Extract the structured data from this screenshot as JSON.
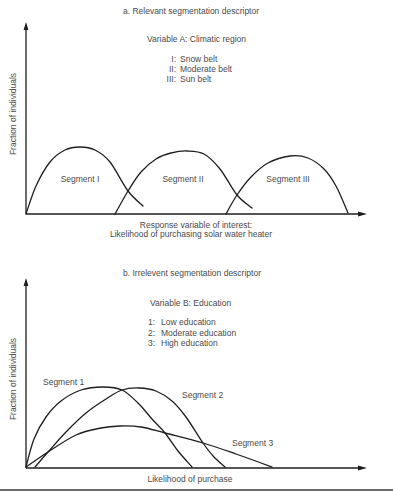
{
  "chart_data": [
    {
      "type": "line",
      "panel": "a",
      "title": "a. Relevant segmentation descriptor",
      "legend_title": "Variable A: Climatic region",
      "legend": [
        {
          "key": "I:",
          "label": "Snow belt"
        },
        {
          "key": "II:",
          "label": "Moderate belt"
        },
        {
          "key": "III:",
          "label": "Sun belt"
        }
      ],
      "xlabel_line1": "Response variable of interest:",
      "xlabel_line2": "Likelihood of purchasing solar water heater",
      "ylabel": "Fraction of individuals",
      "xlim": [
        0,
        340
      ],
      "ylim": [
        0,
        190
      ],
      "grid": false,
      "ticks": false,
      "series": [
        {
          "name": "Segment I",
          "points": [
            [
              0,
              0
            ],
            [
              10,
              28
            ],
            [
              24,
              52
            ],
            [
              39,
              64
            ],
            [
              54,
              67
            ],
            [
              69,
              64
            ],
            [
              84,
              52
            ],
            [
              102,
              23
            ],
            [
              117,
              8
            ]
          ]
        },
        {
          "name": "Segment II",
          "points": [
            [
              89,
              0
            ],
            [
              102,
              23
            ],
            [
              115,
              42
            ],
            [
              130,
              55
            ],
            [
              145,
              61
            ],
            [
              161,
              63
            ],
            [
              178,
              60
            ],
            [
              194,
              45
            ],
            [
              211,
              19
            ],
            [
              226,
              6
            ]
          ]
        },
        {
          "name": "Segment III",
          "points": [
            [
              200,
              0
            ],
            [
              211,
              19
            ],
            [
              225,
              37
            ],
            [
              242,
              51
            ],
            [
              264,
              58
            ],
            [
              282,
              56
            ],
            [
              298,
              45
            ],
            [
              310,
              28
            ],
            [
              322,
              1
            ]
          ]
        }
      ]
    },
    {
      "type": "line",
      "panel": "b",
      "title": "b. Irrelevent segmentation descriptor",
      "legend_title": "Variable B: Education",
      "legend": [
        {
          "key": "1:",
          "label": "Low education"
        },
        {
          "key": "2:",
          "label": "Moderate education"
        },
        {
          "key": "3:",
          "label": "High education"
        }
      ],
      "xlabel": "Likelihood of purchase",
      "ylabel": "Fraction of individuals",
      "xlim": [
        0,
        340
      ],
      "ylim": [
        0,
        188
      ],
      "grid": false,
      "ticks": false,
      "series": [
        {
          "name": "Segment 1",
          "points": [
            [
              0,
              0
            ],
            [
              8,
              28
            ],
            [
              20,
              50
            ],
            [
              35,
              66
            ],
            [
              55,
              77
            ],
            [
              77,
              80
            ],
            [
              96,
              77
            ],
            [
              112,
              64
            ],
            [
              126,
              48
            ],
            [
              139,
              34
            ],
            [
              152,
              16
            ],
            [
              166,
              0
            ]
          ]
        },
        {
          "name": "Segment 2",
          "points": [
            [
              9,
              0
            ],
            [
              22,
              15
            ],
            [
              40,
              35
            ],
            [
              60,
              54
            ],
            [
              80,
              68
            ],
            [
              96,
              77
            ],
            [
              113,
              79
            ],
            [
              130,
              76
            ],
            [
              146,
              66
            ],
            [
              160,
              50
            ],
            [
              177,
              24
            ],
            [
              188,
              10
            ],
            [
              199,
              0
            ]
          ]
        },
        {
          "name": "Segment 3",
          "points": [
            [
              0,
              0
            ],
            [
              22,
              15
            ],
            [
              50,
              32
            ],
            [
              75,
              39
            ],
            [
              94,
              41
            ],
            [
              115,
              40
            ],
            [
              139,
              34
            ],
            [
              177,
              24
            ],
            [
              210,
              13
            ],
            [
              246,
              0
            ]
          ]
        }
      ]
    }
  ]
}
